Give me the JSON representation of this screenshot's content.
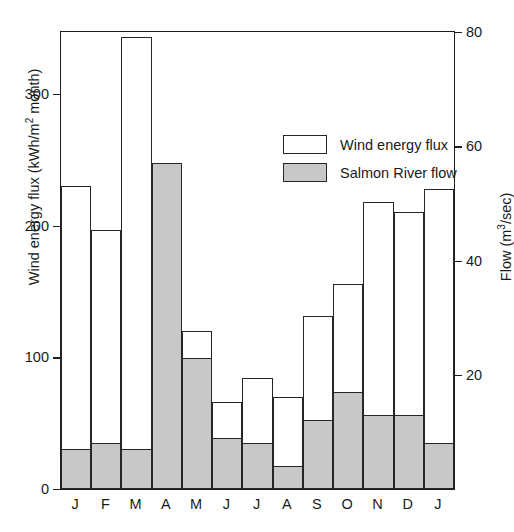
{
  "figure": {
    "cropped_caption": "",
    "background": "#ffffff"
  },
  "axis": {
    "left_title_main": "Wind energy flux (kWh/m",
    "left_title_sup": "2",
    "left_title_tail": " month)",
    "right_title_main": "Flow (m",
    "right_title_sup": "3",
    "right_title_tail": "/sec)",
    "left_ticks": [
      "0",
      "100",
      "200",
      "300"
    ],
    "right_ticks": [
      "20",
      "40",
      "60",
      "80"
    ]
  },
  "legend": {
    "items": [
      {
        "label": "Wind energy flux",
        "swatch": "white",
        "color": "#ffffff"
      },
      {
        "label": "Salmon River flow",
        "swatch": "gray",
        "color": "#c8c8c8"
      }
    ]
  },
  "chart_data": {
    "type": "bar",
    "title": "",
    "subtitle": "",
    "xlabel": "",
    "ylabel": "Wind energy flux (kWh/m2 month)",
    "y2label": "Flow (m3/sec)",
    "ylim": [
      0,
      347
    ],
    "y2lim": [
      0,
      80
    ],
    "ytick_values": [
      0,
      100,
      200,
      300
    ],
    "y2tick_values": [
      20,
      40,
      60,
      80
    ],
    "grid": false,
    "legend_position": "upper-center",
    "bar_style": "overlaid (flow drawn in front of wind, shared baseline)",
    "categories": [
      "J",
      "F",
      "M",
      "A",
      "M",
      "J",
      "J",
      "A",
      "S",
      "O",
      "N",
      "D",
      "J"
    ],
    "category_names": [
      "January",
      "February",
      "March",
      "April",
      "May",
      "June",
      "July",
      "August",
      "September",
      "October",
      "November",
      "December",
      "January"
    ],
    "series": [
      {
        "name": "Wind energy flux",
        "units": "kWh/m2 month",
        "axis": "left",
        "color": "#ffffff",
        "values": [
          230,
          197,
          343,
          229,
          120,
          66,
          84,
          70,
          131,
          156,
          218,
          210,
          228
        ]
      },
      {
        "name": "Salmon River flow",
        "units": "m3/sec",
        "axis": "right",
        "color": "#c8c8c8",
        "values": [
          7,
          8,
          7,
          57,
          23,
          9,
          8,
          4,
          12,
          17,
          13,
          13,
          8
        ]
      }
    ]
  }
}
